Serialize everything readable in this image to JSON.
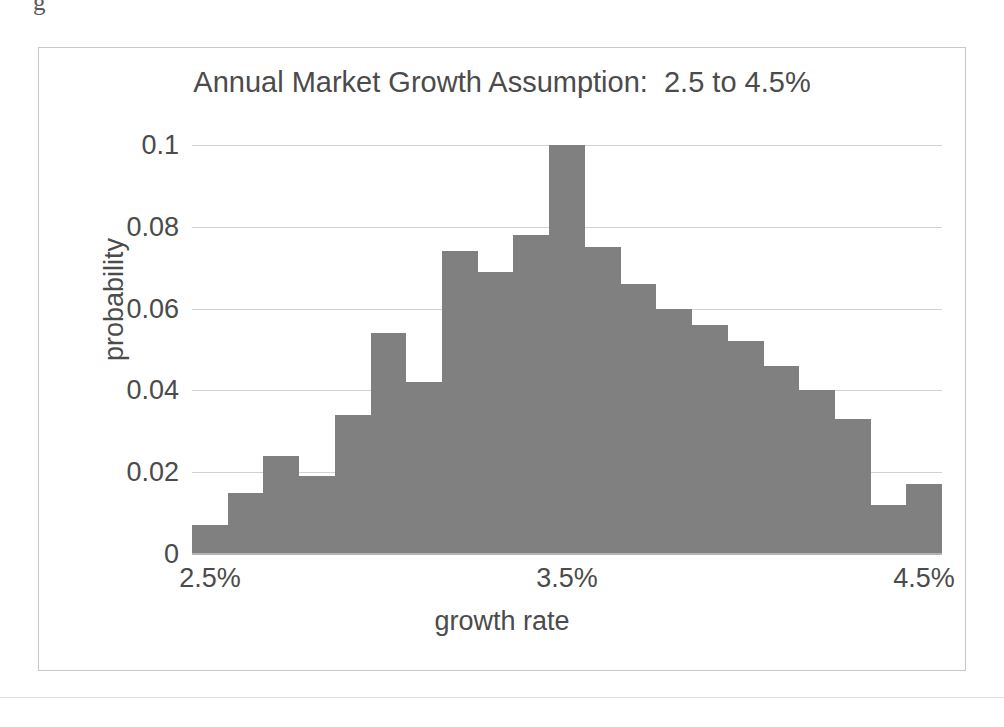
{
  "figure": {
    "scan_artifact_text": "g",
    "frame_border_color": "#c8c8c8",
    "background_color": "#ffffff"
  },
  "chart_data": {
    "type": "bar",
    "title": "Annual Market Growth Assumption:  2.5 to 4.5%",
    "xlabel": "growth rate",
    "ylabel": "probability",
    "ylim": [
      0,
      0.1
    ],
    "xlim": [
      2.5,
      4.5
    ],
    "grid": true,
    "legend": null,
    "bar_color": "#808080",
    "ytick_labels": [
      "0.1",
      "0.08",
      "0.06",
      "0.04",
      "0.02",
      "0"
    ],
    "ytick_values": [
      0.1,
      0.08,
      0.06,
      0.04,
      0.02,
      0
    ],
    "xtick_labels": [
      "2.5%",
      "3.5%",
      "4.5%"
    ],
    "xtick_values": [
      2.5,
      3.5,
      4.5
    ],
    "bin_edges": [
      2.5,
      2.595,
      2.69,
      2.786,
      2.881,
      2.976,
      3.071,
      3.167,
      3.262,
      3.357,
      3.452,
      3.548,
      3.643,
      3.738,
      3.833,
      3.929,
      4.024,
      4.119,
      4.214,
      4.31,
      4.405,
      4.5
    ],
    "categories": [
      "2.50-2.60",
      "2.60-2.69",
      "2.69-2.79",
      "2.79-2.88",
      "2.88-2.98",
      "2.98-3.07",
      "3.07-3.17",
      "3.17-3.26",
      "3.26-3.36",
      "3.36-3.45",
      "3.45-3.55",
      "3.55-3.64",
      "3.64-3.74",
      "3.74-3.83",
      "3.83-3.93",
      "3.93-4.02",
      "4.02-4.12",
      "4.12-4.21",
      "4.21-4.31",
      "4.31-4.40",
      "4.40-4.50"
    ],
    "values": [
      0.007,
      0.015,
      0.024,
      0.019,
      0.034,
      0.054,
      0.042,
      0.074,
      0.069,
      0.078,
      0.1,
      0.075,
      0.066,
      0.06,
      0.056,
      0.052,
      0.046,
      0.04,
      0.033,
      0.012,
      0.017
    ]
  }
}
